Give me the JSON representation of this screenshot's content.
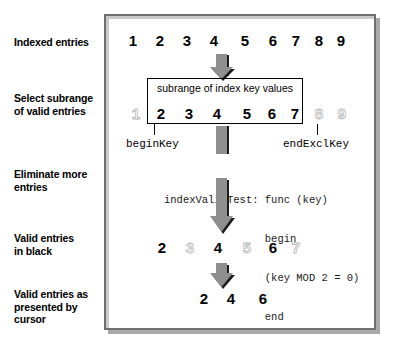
{
  "diagram": {
    "stages": [
      {
        "name": "indexed-entries",
        "label": "Indexed entries"
      },
      {
        "name": "select-subrange",
        "label": "Select subrange\nof valid entries"
      },
      {
        "name": "eliminate-entries",
        "label": "Eliminate more\nentries"
      },
      {
        "name": "valid-in-black",
        "label": "Valid entries\nin black"
      },
      {
        "name": "cursor-presented",
        "label": "Valid entries as\npresented by\ncursor"
      }
    ],
    "rows": {
      "indexed": {
        "name": "indexed-entries-row",
        "entries": [
          {
            "value": "1",
            "dim": false,
            "x": 126
          },
          {
            "value": "2",
            "dim": false,
            "x": 153
          },
          {
            "value": "3",
            "dim": false,
            "x": 180
          },
          {
            "value": "4",
            "dim": false,
            "x": 207
          },
          {
            "value": "5",
            "dim": false,
            "x": 238
          },
          {
            "value": "6",
            "dim": false,
            "x": 266
          },
          {
            "value": "7",
            "dim": false,
            "x": 289
          },
          {
            "value": "8",
            "dim": false,
            "x": 312
          },
          {
            "value": "9",
            "dim": false,
            "x": 334
          }
        ]
      },
      "subrange": {
        "name": "subrange-entries-row",
        "entries": [
          {
            "value": "1",
            "dim": true,
            "x": 129
          },
          {
            "value": "2",
            "dim": false,
            "x": 154
          },
          {
            "value": "3",
            "dim": false,
            "x": 182
          },
          {
            "value": "4",
            "dim": false,
            "x": 210
          },
          {
            "value": "5",
            "dim": false,
            "x": 240
          },
          {
            "value": "6",
            "dim": false,
            "x": 265
          },
          {
            "value": "7",
            "dim": false,
            "x": 288
          },
          {
            "value": "8",
            "dim": true,
            "x": 312
          },
          {
            "value": "9",
            "dim": true,
            "x": 335
          }
        ]
      },
      "valid_black": {
        "name": "valid-entries-black-row",
        "entries": [
          {
            "value": "2",
            "dim": false,
            "x": 155
          },
          {
            "value": "3",
            "dim": true,
            "x": 183
          },
          {
            "value": "4",
            "dim": false,
            "x": 211
          },
          {
            "value": "5",
            "dim": true,
            "x": 240
          },
          {
            "value": "6",
            "dim": false,
            "x": 266
          },
          {
            "value": "7",
            "dim": true,
            "x": 289
          }
        ]
      },
      "cursor": {
        "name": "cursor-entries-row",
        "entries": [
          {
            "value": "2",
            "dim": false,
            "x": 197
          },
          {
            "value": "4",
            "dim": false,
            "x": 224
          },
          {
            "value": "6",
            "dim": false,
            "x": 256
          }
        ]
      }
    },
    "subrange_box": {
      "title": "subrange of index key values"
    },
    "keys": {
      "begin": "beginKey",
      "end_excl": "endExclKey"
    },
    "code": {
      "lines": [
        "indexValidTest: func (key)",
        "                begin",
        "                (key MOD 2 = 0)",
        "                end"
      ]
    },
    "colors": {
      "arrow_fill": "#8f8f8f",
      "arrow_shadow": "#1c1c1c",
      "frame_border": "#6e6e6e",
      "frame_shadow": "#a9a9a9",
      "dim_entry": "#d4d4d4",
      "text": "#000000"
    }
  }
}
